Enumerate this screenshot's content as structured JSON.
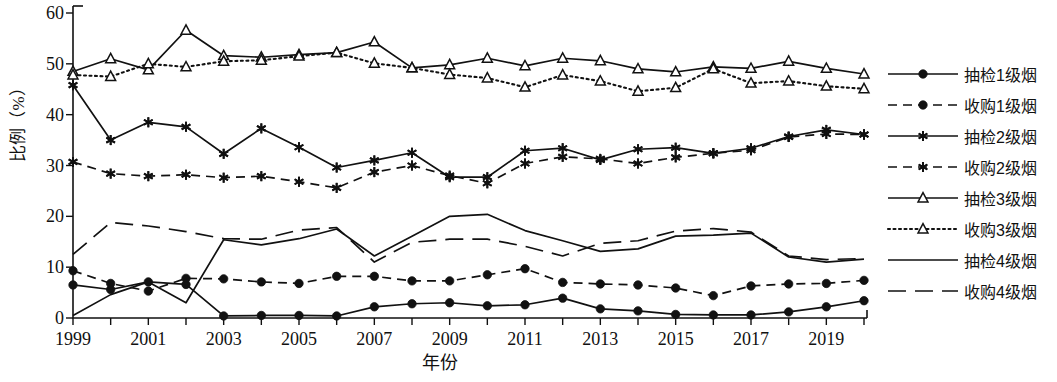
{
  "chart_data": {
    "type": "line",
    "title": "",
    "xlabel": "年份",
    "ylabel": "比例（%）",
    "xlim": [
      1999,
      2020
    ],
    "ylim": [
      0,
      60
    ],
    "yticks": [
      0,
      10,
      20,
      30,
      40,
      50,
      60
    ],
    "xticks": [
      1999,
      2001,
      2003,
      2005,
      2007,
      2009,
      2011,
      2013,
      2015,
      2017,
      2019
    ],
    "x": [
      1999,
      2000,
      2001,
      2002,
      2003,
      2004,
      2005,
      2006,
      2007,
      2008,
      2009,
      2010,
      2011,
      2012,
      2013,
      2014,
      2015,
      2016,
      2017,
      2018,
      2019,
      2020
    ],
    "grid": false,
    "legend_position": "right",
    "series": [
      {
        "name": "抽检1级烟",
        "marker": "filled-circle",
        "dash": "solid",
        "values": [
          6.5,
          5.6,
          7.1,
          6.6,
          0.4,
          0.5,
          0.5,
          0.4,
          2.2,
          2.8,
          3.0,
          2.4,
          2.6,
          3.9,
          1.8,
          1.4,
          0.7,
          0.6,
          0.6,
          1.2,
          2.2,
          3.4
        ]
      },
      {
        "name": "收购1级烟",
        "marker": "filled-circle",
        "dash": "dashed",
        "values": [
          9.3,
          6.8,
          5.3,
          7.8,
          7.7,
          7.1,
          6.8,
          8.2,
          8.2,
          7.3,
          7.3,
          8.5,
          9.7,
          7.0,
          6.7,
          6.5,
          5.9,
          4.4,
          6.3,
          6.7,
          6.8,
          7.4
        ]
      },
      {
        "name": "抽检2级烟",
        "marker": "asterisk",
        "dash": "solid",
        "values": [
          45.8,
          35.0,
          38.5,
          37.6,
          32.3,
          37.3,
          33.6,
          29.6,
          31.0,
          32.5,
          27.7,
          27.7,
          32.9,
          33.4,
          31.1,
          33.2,
          33.5,
          32.4,
          33.4,
          35.7,
          37.0,
          36.1
        ]
      },
      {
        "name": "收购2级烟",
        "marker": "asterisk",
        "dash": "dashed",
        "values": [
          30.7,
          28.4,
          27.9,
          28.2,
          27.6,
          27.9,
          26.8,
          25.6,
          28.7,
          30.0,
          28.0,
          26.5,
          30.4,
          31.7,
          31.3,
          30.4,
          31.6,
          32.4,
          33.0,
          35.6,
          36.2,
          36.1
        ]
      },
      {
        "name": "抽检3级烟",
        "marker": "open-triangle",
        "dash": "solid",
        "values": [
          48.5,
          51.0,
          48.8,
          56.6,
          51.6,
          51.3,
          51.8,
          52.2,
          54.3,
          49.2,
          49.8,
          51.1,
          49.6,
          51.1,
          50.6,
          49.0,
          48.4,
          49.4,
          49.1,
          50.5,
          49.1,
          48.0
        ]
      },
      {
        "name": "收购3级烟",
        "marker": "open-triangle",
        "dash": "dotted",
        "values": [
          47.8,
          47.5,
          50.0,
          49.4,
          50.5,
          50.7,
          51.5,
          52.2,
          50.1,
          49.2,
          47.9,
          47.2,
          45.4,
          47.8,
          46.6,
          44.6,
          45.3,
          49.0,
          46.2,
          46.6,
          45.6,
          45.1
        ]
      },
      {
        "name": "抽检4级烟",
        "marker": "none",
        "dash": "solid",
        "values": [
          0.5,
          4.6,
          7.1,
          3.0,
          15.4,
          14.4,
          15.6,
          17.5,
          12.2,
          16.1,
          20.0,
          20.4,
          17.2,
          15.2,
          13.1,
          13.6,
          16.1,
          16.3,
          16.7,
          12.0,
          11.0,
          11.6
        ]
      },
      {
        "name": "收购4级烟",
        "marker": "none",
        "dash": "long-dashed",
        "values": [
          12.5,
          18.8,
          18.1,
          17.0,
          15.6,
          15.5,
          17.3,
          17.8,
          11.0,
          14.9,
          15.5,
          15.5,
          14.1,
          12.2,
          14.7,
          15.2,
          17.1,
          17.6,
          16.9,
          12.2,
          11.5,
          11.7
        ]
      }
    ]
  },
  "legend": {
    "items": [
      {
        "label": "抽检1级烟"
      },
      {
        "label": "收购1级烟"
      },
      {
        "label": "抽检2级烟"
      },
      {
        "label": "收购2级烟"
      },
      {
        "label": "抽检3级烟"
      },
      {
        "label": "收购3级烟"
      },
      {
        "label": "抽检4级烟"
      },
      {
        "label": "收购4级烟"
      }
    ]
  },
  "colors": {
    "ink": "#111111",
    "background": "#ffffff"
  }
}
